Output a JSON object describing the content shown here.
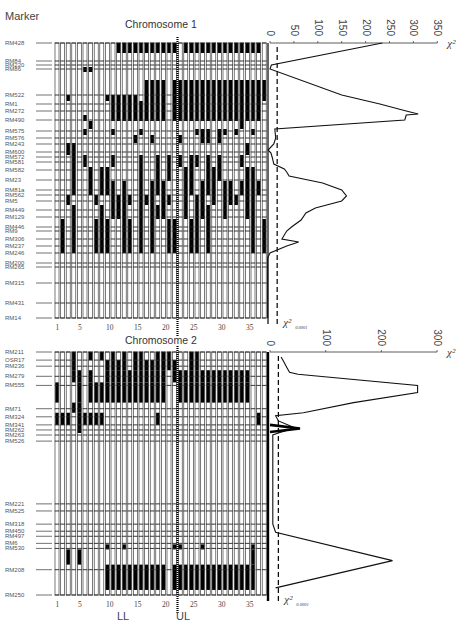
{
  "figure": {
    "header_label": "Marker",
    "lower_labels": {
      "left": "LL",
      "right": "UL"
    },
    "column_ticks": [
      1,
      5,
      10,
      15,
      20,
      25,
      30,
      35
    ],
    "n_columns": 38,
    "divider_after_column": 22,
    "threshold_label": "χ²",
    "threshold_subscript": "0.0001",
    "chi_axis_label": "χ²"
  },
  "chart_data": [
    {
      "type": "line",
      "title": "Chromosome 1",
      "xlabel": "χ²",
      "ylabel": "Marker",
      "xlim": [
        0,
        350
      ],
      "x_ticks": [
        0,
        50,
        100,
        150,
        200,
        250,
        300,
        350
      ],
      "threshold": 15,
      "markers": [
        {
          "name": "RM428",
          "pos": 0
        },
        {
          "name": "RM84",
          "pos": 18
        },
        {
          "name": "RM220",
          "pos": 22
        },
        {
          "name": "RM86",
          "pos": 26
        },
        {
          "name": "RM522",
          "pos": 52
        },
        {
          "name": "RM1",
          "pos": 61
        },
        {
          "name": "RM272",
          "pos": 68
        },
        {
          "name": "RM490",
          "pos": 77
        },
        {
          "name": "RM575",
          "pos": 88
        },
        {
          "name": "RM576",
          "pos": 95
        },
        {
          "name": "RM243",
          "pos": 101
        },
        {
          "name": "RM600",
          "pos": 109
        },
        {
          "name": "RM572",
          "pos": 114
        },
        {
          "name": "RM581",
          "pos": 119
        },
        {
          "name": "RM582",
          "pos": 127
        },
        {
          "name": "RM23",
          "pos": 137
        },
        {
          "name": "RM81a",
          "pos": 147
        },
        {
          "name": "RM562",
          "pos": 152
        },
        {
          "name": "RM5",
          "pos": 158
        },
        {
          "name": "RM449",
          "pos": 167
        },
        {
          "name": "RM129",
          "pos": 174
        },
        {
          "name": "RM446",
          "pos": 184
        },
        {
          "name": "RM9",
          "pos": 188
        },
        {
          "name": "RM306",
          "pos": 196
        },
        {
          "name": "RM237",
          "pos": 203
        },
        {
          "name": "RM246",
          "pos": 210
        },
        {
          "name": "RM200",
          "pos": 220
        },
        {
          "name": "RM265",
          "pos": 224
        },
        {
          "name": "RM315",
          "pos": 240
        },
        {
          "name": "RM431",
          "pos": 260
        },
        {
          "name": "RM14",
          "pos": 275
        }
      ],
      "chi_profile": [
        {
          "pos": 0,
          "chi": 235
        },
        {
          "pos": 22,
          "chi": 3
        },
        {
          "pos": 26,
          "chi": 0
        },
        {
          "pos": 52,
          "chi": 150
        },
        {
          "pos": 61,
          "chi": 230
        },
        {
          "pos": 68,
          "chi": 285
        },
        {
          "pos": 71,
          "chi": 310
        },
        {
          "pos": 72,
          "chi": 285
        },
        {
          "pos": 77,
          "chi": 282
        },
        {
          "pos": 86,
          "chi": 10
        },
        {
          "pos": 95,
          "chi": 12
        },
        {
          "pos": 101,
          "chi": 8
        },
        {
          "pos": 107,
          "chi": -4
        },
        {
          "pos": 110,
          "chi": 2
        },
        {
          "pos": 115,
          "chi": 5
        },
        {
          "pos": 121,
          "chi": 8
        },
        {
          "pos": 126,
          "chi": 30
        },
        {
          "pos": 129,
          "chi": 35
        },
        {
          "pos": 133,
          "chi": 40
        },
        {
          "pos": 140,
          "chi": 110
        },
        {
          "pos": 147,
          "chi": 150
        },
        {
          "pos": 153,
          "chi": 160
        },
        {
          "pos": 158,
          "chi": 150
        },
        {
          "pos": 165,
          "chi": 95
        },
        {
          "pos": 170,
          "chi": 75
        },
        {
          "pos": 177,
          "chi": 65
        },
        {
          "pos": 184,
          "chi": 45
        },
        {
          "pos": 188,
          "chi": 35
        },
        {
          "pos": 196,
          "chi": 25
        },
        {
          "pos": 199,
          "chi": 60
        },
        {
          "pos": 203,
          "chi": 35
        },
        {
          "pos": 210,
          "chi": 0
        },
        {
          "pos": 215,
          "chi": -5
        },
        {
          "pos": 275,
          "chi": -5
        }
      ],
      "grid": {
        "rows": [
          {
            "from": 0,
            "to": 10,
            "black": [
              12,
              13,
              14,
              15,
              16,
              17,
              18,
              19,
              20,
              21,
              22,
              24,
              25,
              26,
              27,
              28,
              29,
              30,
              31,
              32,
              33,
              34,
              35,
              36,
              37
            ]
          },
          {
            "from": 24,
            "to": 29,
            "black": [
              6,
              7
            ]
          },
          {
            "from": 37,
            "to": 52,
            "black": [
              17,
              18,
              19,
              20,
              22,
              23,
              24,
              25,
              26,
              27,
              28,
              29,
              30,
              31,
              32,
              33,
              34,
              35,
              36,
              37,
              38
            ]
          },
          {
            "from": 52,
            "to": 58,
            "black": [
              3,
              10,
              11,
              12,
              13,
              14,
              15,
              17,
              18,
              19,
              20,
              22,
              23,
              24,
              25,
              26,
              27,
              28,
              29,
              30,
              31,
              32,
              33,
              34,
              35,
              36,
              37,
              38
            ]
          },
          {
            "from": 58,
            "to": 72,
            "black": [
              11,
              12,
              13,
              14,
              15,
              16,
              17,
              18,
              19,
              20,
              22,
              23,
              24,
              25,
              26,
              27,
              28,
              29,
              30,
              31,
              32,
              33,
              34,
              35,
              36,
              37
            ]
          },
          {
            "from": 72,
            "to": 78,
            "black": [
              6,
              11,
              12,
              13,
              14,
              15,
              16,
              17,
              18,
              19,
              20,
              22,
              23,
              24,
              25,
              26,
              27,
              28,
              29,
              30,
              31,
              32,
              33,
              34,
              35,
              36,
              37
            ]
          },
          {
            "from": 78,
            "to": 86,
            "black": [
              7,
              34
            ]
          },
          {
            "from": 86,
            "to": 92,
            "black": [
              6,
              11,
              16,
              26,
              27,
              28,
              30,
              31,
              33,
              36
            ]
          },
          {
            "from": 92,
            "to": 100,
            "black": [
              15,
              18,
              23,
              27,
              28,
              30
            ]
          },
          {
            "from": 100,
            "to": 112,
            "black": [
              3,
              4,
              35
            ]
          },
          {
            "from": 112,
            "to": 124,
            "black": [
              4,
              6,
              11,
              16,
              19,
              21,
              23,
              25,
              26,
              28,
              30,
              34
            ]
          },
          {
            "from": 124,
            "to": 138,
            "black": [
              4,
              7,
              9,
              10,
              16,
              19,
              21,
              24,
              25,
              28,
              29,
              30,
              35,
              36
            ]
          },
          {
            "from": 138,
            "to": 152,
            "black": [
              4,
              7,
              9,
              10,
              11,
              13,
              16,
              18,
              19,
              20,
              24,
              25,
              27,
              28,
              29,
              31,
              32,
              34,
              35,
              36,
              37
            ]
          },
          {
            "from": 152,
            "to": 162,
            "black": [
              3,
              8,
              11,
              12,
              13,
              14,
              16,
              17,
              18,
              20,
              21,
              24,
              26,
              27,
              29,
              31,
              32,
              33,
              35,
              36
            ]
          },
          {
            "from": 162,
            "to": 176,
            "black": [
              4,
              9,
              11,
              12,
              13,
              16,
              18,
              19,
              20,
              24,
              26,
              27,
              28,
              31,
              35,
              36
            ]
          },
          {
            "from": 176,
            "to": 192,
            "black": [
              2,
              4,
              8,
              9,
              10,
              13,
              14,
              16,
              18,
              21,
              22,
              25,
              26,
              28,
              36,
              38
            ]
          },
          {
            "from": 192,
            "to": 210,
            "black": [
              2,
              4,
              8,
              9,
              10,
              13,
              14,
              16,
              18,
              21,
              22,
              25,
              26,
              28,
              36,
              38
            ]
          }
        ]
      }
    },
    {
      "type": "line",
      "title": "Chromosome 2",
      "xlabel": "χ²",
      "ylabel": "Marker",
      "xlim": [
        0,
        300
      ],
      "x_ticks": [
        0,
        100,
        200,
        300
      ],
      "threshold": 15,
      "markers": [
        {
          "name": "RM211",
          "pos": 0
        },
        {
          "name": "OSR17",
          "pos": 8
        },
        {
          "name": "RM236",
          "pos": 14
        },
        {
          "name": "RM279",
          "pos": 24
        },
        {
          "name": "RM555",
          "pos": 33
        },
        {
          "name": "RM71",
          "pos": 56
        },
        {
          "name": "RM324",
          "pos": 64
        },
        {
          "name": "RM341",
          "pos": 72
        },
        {
          "name": "RM262",
          "pos": 77
        },
        {
          "name": "RM263",
          "pos": 82
        },
        {
          "name": "RM526",
          "pos": 88
        },
        {
          "name": "RM221",
          "pos": 150
        },
        {
          "name": "RM525",
          "pos": 157
        },
        {
          "name": "RM318",
          "pos": 170
        },
        {
          "name": "RM450",
          "pos": 177
        },
        {
          "name": "RM497",
          "pos": 182
        },
        {
          "name": "RM6",
          "pos": 189
        },
        {
          "name": "RM530",
          "pos": 194
        },
        {
          "name": "RM208",
          "pos": 215
        },
        {
          "name": "RM250",
          "pos": 240
        }
      ],
      "chi_profile": [
        {
          "pos": 5,
          "chi": 20
        },
        {
          "pos": 10,
          "chi": 25
        },
        {
          "pos": 15,
          "chi": 30
        },
        {
          "pos": 20,
          "chi": 35
        },
        {
          "pos": 22,
          "chi": 50
        },
        {
          "pos": 33,
          "chi": 265
        },
        {
          "pos": 40,
          "chi": 265
        },
        {
          "pos": 50,
          "chi": 150
        },
        {
          "pos": 60,
          "chi": 60
        },
        {
          "pos": 63,
          "chi": 10
        },
        {
          "pos": 68,
          "chi": 15
        },
        {
          "pos": 75,
          "chi": 45
        },
        {
          "pos": 80,
          "chi": 15
        },
        {
          "pos": 82,
          "chi": 5
        },
        {
          "pos": 170,
          "chi": 5
        },
        {
          "pos": 178,
          "chi": 10
        },
        {
          "pos": 206,
          "chi": 220
        },
        {
          "pos": 233,
          "chi": 10
        }
      ],
      "grid": {
        "rows": [
          {
            "from": 0,
            "to": 8,
            "black": [
              4,
              7,
              9,
              11,
              13,
              15,
              16,
              19,
              20,
              21,
              25,
              26
            ]
          },
          {
            "from": 8,
            "to": 18,
            "black": [
              4,
              10,
              11,
              12,
              13,
              15,
              16,
              17,
              18,
              19,
              20,
              21,
              22,
              25,
              26
            ]
          },
          {
            "from": 18,
            "to": 30,
            "black": [
              4,
              5,
              7,
              10,
              11,
              12,
              13,
              14,
              15,
              16,
              17,
              18,
              19,
              20,
              22,
              23,
              24,
              25,
              26,
              27,
              28,
              29,
              30,
              31,
              32,
              33,
              34,
              35
            ]
          },
          {
            "from": 30,
            "to": 50,
            "black": [
              1,
              5,
              7,
              8,
              9,
              10,
              11,
              12,
              13,
              14,
              15,
              16,
              17,
              18,
              19,
              20,
              23,
              24,
              25,
              26,
              27,
              28,
              29,
              30,
              31,
              32,
              33,
              34,
              35
            ]
          },
          {
            "from": 50,
            "to": 60,
            "black": [
              4,
              5
            ]
          },
          {
            "from": 60,
            "to": 72,
            "black": [
              1,
              2,
              3,
              5,
              6,
              7,
              8,
              9,
              19,
              37
            ]
          },
          {
            "from": 72,
            "to": 80,
            "black": [
              5
            ]
          },
          {
            "from": 190,
            "to": 195,
            "black": [
              10,
              13,
              22,
              23,
              27,
              36
            ]
          },
          {
            "from": 195,
            "to": 210,
            "black": [
              3,
              5,
              36
            ]
          },
          {
            "from": 210,
            "to": 235,
            "black": [
              10,
              11,
              12,
              13,
              14,
              15,
              16,
              17,
              18,
              19,
              20,
              22,
              23,
              24,
              25,
              26,
              27,
              28,
              29,
              30,
              31,
              32,
              33,
              34,
              35,
              36
            ]
          }
        ]
      }
    }
  ]
}
